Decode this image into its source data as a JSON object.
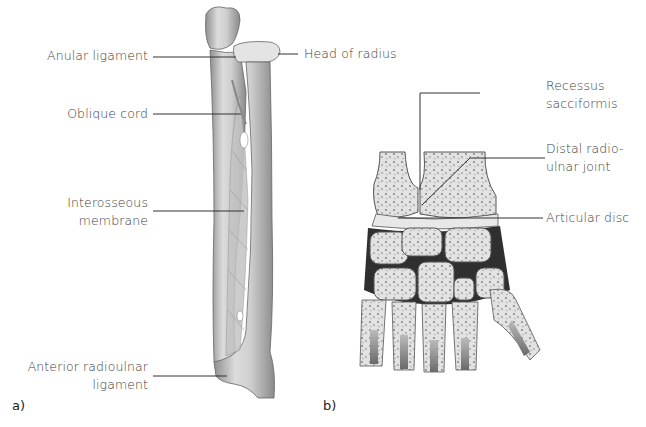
{
  "figure": {
    "panel_a": {
      "label": "a)",
      "title": "Forearm bones (radius and ulna) with connecting ligaments",
      "callouts": [
        {
          "text": "Anular ligament"
        },
        {
          "text": "Oblique cord"
        },
        {
          "text_line1": "Interosseous",
          "text_line2": "membrane"
        },
        {
          "text_line1": "Anterior radioulnar",
          "text_line2": "ligament"
        },
        {
          "text": "Head of radius"
        }
      ]
    },
    "panel_b": {
      "label": "b)",
      "title": "Cross-section of wrist joint",
      "callouts": [
        {
          "text_line1": "Recessus",
          "text_line2": "sacciformis"
        },
        {
          "text_line1": "Distal radio-",
          "text_line2": "ulnar joint"
        },
        {
          "text": "Articular disc"
        }
      ]
    },
    "colors": {
      "bone": "#d9d9d9",
      "bone_shadow": "#9a9a9a",
      "cartilage": "#e8e8e8",
      "joint_dark": "#2a2a2a",
      "leader_line": "#333333",
      "text": "#3d3d3d"
    }
  }
}
